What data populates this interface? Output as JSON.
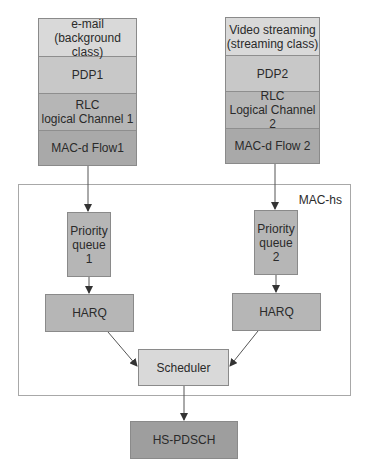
{
  "diagram": {
    "left_stack": {
      "rows": [
        {
          "label": "e-mail\n(background class)"
        },
        {
          "label": "PDP1"
        },
        {
          "label": "RLC\nlogical Channel 1"
        },
        {
          "label": "MAC-d Flow1"
        }
      ]
    },
    "right_stack": {
      "rows": [
        {
          "label": "Video streaming\n(streaming class)"
        },
        {
          "label": "PDP2"
        },
        {
          "label": "RLC\nLogical Channel 2"
        },
        {
          "label": "MAC-d Flow 2"
        }
      ]
    },
    "mac_hs": {
      "label": "MAC-hs",
      "priority_queue_1": "Priority\nqueue\n1",
      "priority_queue_2": "Priority\nqueue\n2",
      "harq_1": "HARQ",
      "harq_2": "HARQ",
      "scheduler": "Scheduler"
    },
    "output": {
      "label": "HS-PDSCH"
    },
    "colors": {
      "light": "#d9d9d9",
      "medium": "#c8c8c8",
      "dark": "#b6b6b6",
      "darkest": "#a9a9a9",
      "border": "#8a8a8a",
      "line": "#555555"
    }
  }
}
